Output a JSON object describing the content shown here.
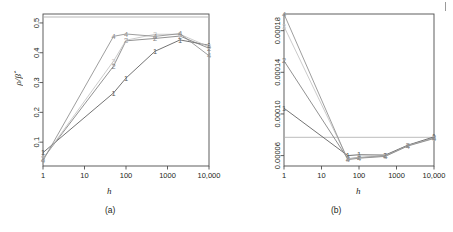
{
  "figure": {
    "panels": [
      {
        "key": "a",
        "caption": "(a)"
      },
      {
        "key": "b",
        "caption": "(b)"
      }
    ],
    "page_edge_mark": "|"
  },
  "chart_data": [
    {
      "type": "line",
      "panel": "a",
      "title": "",
      "caption": "(a)",
      "xlabel": "h",
      "ylabel": "ρ/β̂",
      "ylabel_parts": {
        "numerator": "ρ",
        "slash": "/",
        "denominator": "β",
        "denominator_accent": "̂"
      },
      "xscale": "log",
      "xlim": [
        1,
        10000
      ],
      "ylim": [
        0.02,
        0.53
      ],
      "xticks": [
        1,
        10,
        100,
        1000,
        10000
      ],
      "xticklabels": [
        "1",
        "10",
        "100",
        "1000",
        "10,000"
      ],
      "yticks": [
        0.1,
        0.2,
        0.3,
        0.4,
        0.5
      ],
      "yticklabels": [
        "0.1",
        "0.2",
        "0.3",
        "0.4",
        "0.5"
      ],
      "grid": false,
      "legend": "none",
      "reference_line": {
        "orientation": "horizontal",
        "y": 0.52,
        "color": "#b8b8b8"
      },
      "point_labels": "series number drawn as digit glyph at each point",
      "x": [
        1,
        50,
        100,
        500,
        2000,
        10000
      ],
      "series": [
        {
          "name": "1",
          "marker": "1",
          "color": "#5a5a5a",
          "values": [
            0.065,
            0.265,
            0.315,
            0.405,
            0.443,
            0.425
          ]
        },
        {
          "name": "2",
          "marker": "2",
          "color": "#7d7d7d",
          "values": [
            0.045,
            0.355,
            0.44,
            0.448,
            0.456,
            0.415
          ]
        },
        {
          "name": "3",
          "marker": "3",
          "color": "#c2c2c2",
          "values": [
            0.045,
            0.372,
            0.442,
            0.462,
            0.462,
            0.42
          ]
        },
        {
          "name": "4",
          "marker": "4",
          "color": "#8c8c8c",
          "values": [
            0.038,
            0.455,
            0.463,
            0.455,
            0.464,
            0.39
          ]
        }
      ]
    },
    {
      "type": "line",
      "panel": "b",
      "title": "",
      "caption": "(b)",
      "xlabel": "h",
      "ylabel": "Mean loss",
      "xscale": "log",
      "xlim": [
        1,
        10000
      ],
      "ylim": [
        5e-05,
        0.000196
      ],
      "xticks": [
        1,
        10,
        100,
        1000,
        10000
      ],
      "xticklabels": [
        "1",
        "10",
        "100",
        "1000",
        "10,000"
      ],
      "yticks": [
        6e-05,
        0.0001,
        0.00014,
        0.00018
      ],
      "yticklabels": [
        "0.00006",
        "0.00010",
        "0.00014",
        "0.00018"
      ],
      "grid": false,
      "legend": "none",
      "reference_line": {
        "orientation": "horizontal",
        "y": 7.75e-05,
        "color": "#c9c9c9"
      },
      "point_labels": "series number drawn as digit glyph at each point",
      "x": [
        1,
        50,
        100,
        500,
        2000,
        10000
      ],
      "series": [
        {
          "name": "1",
          "marker": "1",
          "color": "#5a5a5a",
          "values": [
            0.0001055,
            6e-05,
            6.08e-05,
            6.05e-05,
            7e-05,
            7.8e-05
          ]
        },
        {
          "name": "2",
          "marker": "2",
          "color": "#7d7d7d",
          "values": [
            0.000151,
            5.7e-05,
            5.82e-05,
            5.98e-05,
            6.97e-05,
            7.72e-05
          ]
        },
        {
          "name": "3",
          "marker": "3",
          "color": "#c2c2c2",
          "values": [
            0.000184,
            5.68e-05,
            5.78e-05,
            5.94e-05,
            6.94e-05,
            7.68e-05
          ]
        },
        {
          "name": "4",
          "marker": "4",
          "color": "#8c8c8c",
          "values": [
            0.000196,
            5.6e-05,
            5.75e-05,
            5.92e-05,
            6.92e-05,
            7.64e-05
          ]
        }
      ]
    }
  ]
}
